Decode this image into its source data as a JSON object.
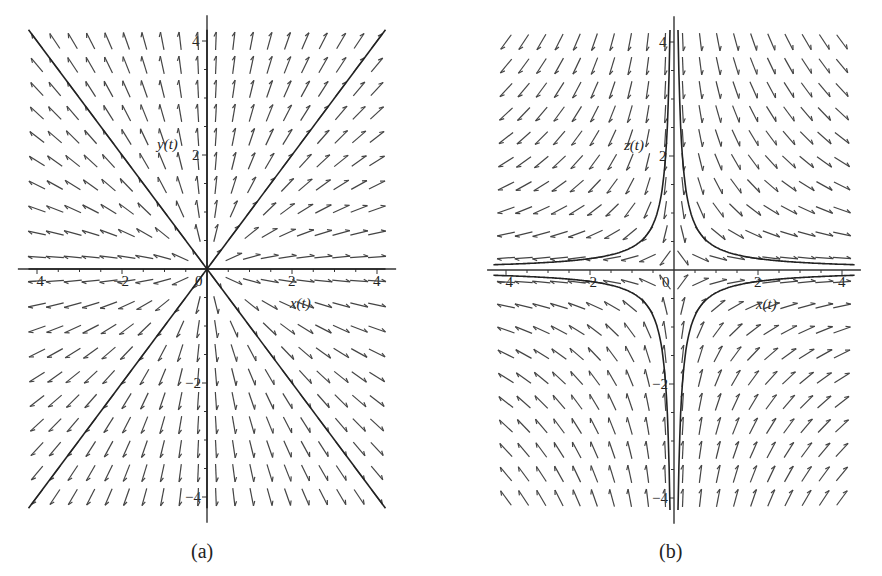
{
  "figure": {
    "panels": [
      {
        "id": "a",
        "caption": "(a)",
        "x_label": "x(t)",
        "y_label": "y(t)"
      },
      {
        "id": "b",
        "caption": "(b)",
        "x_label": "x(t)",
        "y_label": "z(t)"
      }
    ]
  },
  "chart_data": [
    {
      "type": "vector-field",
      "title": "(a)",
      "xlabel": "x(t)",
      "ylabel": "y(t)",
      "xlim": [
        -4.3,
        4.3
      ],
      "ylim": [
        -4.3,
        4.3
      ],
      "x_ticks": [
        -4,
        -2,
        0,
        2,
        4
      ],
      "y_ticks": [
        -4,
        -2,
        2,
        4
      ],
      "field": {
        "dx": "x",
        "dy": "y"
      },
      "grid_points": {
        "x_count": 20,
        "y_count": 20
      },
      "trajectories": [
        {
          "description": "line y = x through origin",
          "points": [
            [
              -4.2,
              -4.2
            ],
            [
              4.2,
              4.2
            ]
          ]
        },
        {
          "description": "line y = -x through origin",
          "points": [
            [
              -4.2,
              4.2
            ],
            [
              4.2,
              -4.2
            ]
          ]
        },
        {
          "description": "line x = 0",
          "points": [
            [
              0,
              -4.2
            ],
            [
              0,
              4.2
            ]
          ]
        },
        {
          "description": "line y = 0",
          "points": [
            [
              -4.2,
              0
            ],
            [
              4.2,
              0
            ]
          ]
        }
      ],
      "grid": false
    },
    {
      "type": "vector-field",
      "title": "(b)",
      "xlabel": "x(t)",
      "ylabel": "z(t)",
      "xlim": [
        -4.3,
        4.3
      ],
      "ylim": [
        -4.3,
        4.3
      ],
      "x_ticks": [
        -4,
        -2,
        0,
        2,
        4
      ],
      "y_ticks": [
        -4,
        -2,
        2,
        4
      ],
      "field": {
        "dx": "x",
        "dy": "-y"
      },
      "grid_points": {
        "x_count": 20,
        "y_count": 20
      },
      "trajectories": [
        {
          "description": "hyperbola x*z = 0.4, quadrant I"
        },
        {
          "description": "hyperbola x*z = 0.4, quadrant III"
        },
        {
          "description": "hyperbola x*z = -0.4, quadrant II"
        },
        {
          "description": "hyperbola x*z = -0.4, quadrant IV"
        }
      ],
      "hyperbola_c": 0.4,
      "grid": false
    }
  ]
}
